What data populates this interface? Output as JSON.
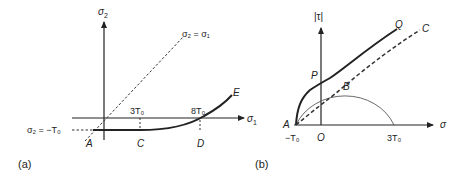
{
  "panel_a": {
    "label": "(a)",
    "y_axis_label": "σ",
    "y_axis_sub": "2",
    "x_axis_label": "σ",
    "x_axis_sub": "1",
    "diagonal_label": "σ₂ = σ₁",
    "offset_label": "σ₂ = −T₀",
    "tick_3T": "3T₀",
    "tick_8T": "8T₀",
    "point_A": "A",
    "point_C": "C",
    "point_D": "D",
    "point_E": "E"
  },
  "panel_b": {
    "label": "(b)",
    "y_axis_label": "|τ|",
    "x_axis_label": "σ",
    "tick_neg": "−T₀",
    "tick_origin": "O",
    "tick_3T": "3T₀",
    "point_A": "A",
    "point_P": "P",
    "point_Q": "Q",
    "point_B": "B",
    "point_C": "C"
  },
  "colors": {
    "ink": "#222222",
    "thin": "#555555"
  }
}
